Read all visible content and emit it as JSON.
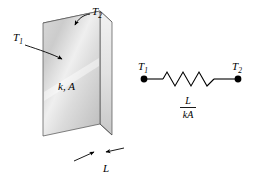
{
  "figure": {
    "background_color": "#ffffff",
    "line_color": "#000000"
  },
  "slab": {
    "name": "plane-wall",
    "front_face_fill_light": "#f2f2f2",
    "front_face_fill_mid": "#d6d6d6",
    "front_face_fill_dark": "#b9b9b9",
    "side_face_fill": "#e4e4e4",
    "top_face_fill": "#cfcfcf",
    "labels": {
      "t1": "T",
      "t1_sub": "1",
      "t2": "T",
      "t2_sub": "2",
      "material": "k, A",
      "thickness": "L"
    }
  },
  "circuit": {
    "name": "thermal-resistance-circuit",
    "left_node_label": "T",
    "left_node_sub": "1",
    "right_node_label": "T",
    "right_node_sub": "2",
    "resistance_numerator": "L",
    "resistance_denominator": "kA",
    "node_fill": "#000000"
  }
}
